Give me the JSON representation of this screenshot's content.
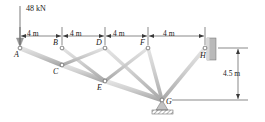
{
  "figure": {
    "background": "#ffffff",
    "member_fill": "#c9c9c9",
    "member_stroke": "#8a8a8a",
    "line_color": "#3a3a3a",
    "support_fill": "#b5b5b5"
  },
  "load": {
    "label": "48 kN",
    "magnitude": 48,
    "unit": "kN",
    "applied_at": "A",
    "direction": "down"
  },
  "dimensions": {
    "horizontal": [
      {
        "label": "4 m",
        "value": 4,
        "unit": "m",
        "from": "A",
        "to": "B"
      },
      {
        "label": "4 m",
        "value": 4,
        "unit": "m",
        "from": "B",
        "to": "D"
      },
      {
        "label": "4 m",
        "value": 4,
        "unit": "m",
        "from": "D",
        "to": "F"
      },
      {
        "label": "4 m",
        "value": 4,
        "unit": "m",
        "from": "F",
        "to": "H"
      }
    ],
    "vertical": [
      {
        "label": "4.5 m",
        "value": 4.5,
        "unit": "m",
        "from": "H",
        "to": "G"
      }
    ]
  },
  "nodes": [
    {
      "id": "A",
      "label": "A",
      "x": 20,
      "y": 48,
      "label_dx": -6,
      "label_dy": 3,
      "support": "none"
    },
    {
      "id": "B",
      "label": "B",
      "x": 62,
      "y": 48,
      "label_dx": -9,
      "label_dy": -9,
      "support": "none"
    },
    {
      "id": "C",
      "label": "C",
      "x": 62,
      "y": 65,
      "label_dx": -9,
      "label_dy": 3,
      "support": "none"
    },
    {
      "id": "D",
      "label": "D",
      "x": 105,
      "y": 48,
      "label_dx": -9,
      "label_dy": -9,
      "support": "none"
    },
    {
      "id": "E",
      "label": "E",
      "x": 105,
      "y": 81,
      "label_dx": -8,
      "label_dy": 3,
      "support": "none"
    },
    {
      "id": "F",
      "label": "F",
      "x": 148,
      "y": 48,
      "label_dx": -8,
      "label_dy": -9,
      "support": "none"
    },
    {
      "id": "G",
      "label": "G",
      "x": 162,
      "y": 100,
      "label_dx": 4,
      "label_dy": -2,
      "support": "pin"
    },
    {
      "id": "H",
      "label": "H",
      "x": 205,
      "y": 48,
      "label_dx": -5,
      "label_dy": 4,
      "support": "wall"
    }
  ],
  "members": [
    {
      "from": "A",
      "to": "B",
      "kind": "top-chord"
    },
    {
      "from": "B",
      "to": "D",
      "kind": "top-chord"
    },
    {
      "from": "D",
      "to": "F",
      "kind": "top-chord"
    },
    {
      "from": "F",
      "to": "H",
      "kind": "top-chord"
    },
    {
      "from": "A",
      "to": "C",
      "kind": "bottom-chord"
    },
    {
      "from": "C",
      "to": "E",
      "kind": "bottom-chord"
    },
    {
      "from": "E",
      "to": "G",
      "kind": "bottom-chord"
    },
    {
      "from": "B",
      "to": "C",
      "kind": "vertical"
    },
    {
      "from": "D",
      "to": "E",
      "kind": "vertical"
    },
    {
      "from": "F",
      "to": "G",
      "kind": "vertical"
    },
    {
      "from": "C",
      "to": "D",
      "kind": "diagonal"
    },
    {
      "from": "E",
      "to": "F",
      "kind": "diagonal"
    },
    {
      "from": "G",
      "to": "H",
      "kind": "diagonal"
    },
    {
      "from": "D",
      "to": "G",
      "kind": "diagonal"
    },
    {
      "from": "B",
      "to": "E",
      "kind": "diagonal"
    }
  ],
  "supports": {
    "pin": {
      "at": "G",
      "type": "pin-hatched-ground"
    },
    "wall": {
      "at": "H",
      "type": "fixed-wall"
    }
  }
}
